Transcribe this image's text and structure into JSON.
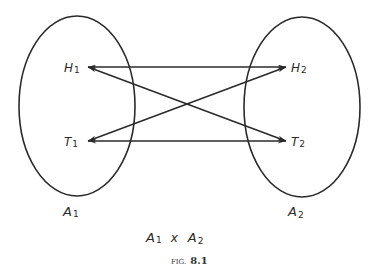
{
  "diagram": {
    "sets": [
      {
        "name": "A",
        "sub": "1",
        "elements": [
          {
            "name": "H",
            "sub": "1"
          },
          {
            "name": "T",
            "sub": "1"
          }
        ]
      },
      {
        "name": "A",
        "sub": "2",
        "elements": [
          {
            "name": "H",
            "sub": "2"
          },
          {
            "name": "T",
            "sub": "2"
          }
        ]
      }
    ],
    "edges": [
      {
        "from": "H1",
        "to": "H2"
      },
      {
        "from": "H1",
        "to": "T2"
      },
      {
        "from": "T1",
        "to": "H2"
      },
      {
        "from": "T1",
        "to": "T2"
      }
    ],
    "product": {
      "left": "A",
      "left_sub": "1",
      "op": "x",
      "right": "A",
      "right_sub": "2"
    },
    "caption": {
      "prefix": "FIG.",
      "number": "8.1"
    }
  }
}
